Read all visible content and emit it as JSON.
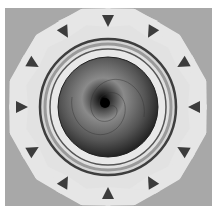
{
  "image": {
    "description": "Abstract mandala render: gray background, twelve-lobed light petal ring with dark triangular notches, concentric metallic rings, dark spiral sphere center",
    "colors": {
      "background": "#a8a8a8",
      "petals": "#e4e4e4",
      "ring_dark": "#4a4a4a",
      "sphere_center": "#0a0a0a",
      "sphere_edge": "#3a3a3a"
    },
    "petal_count": 12
  }
}
